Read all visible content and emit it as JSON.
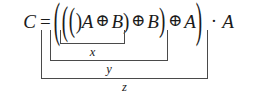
{
  "figure": {
    "kind": "math-equation-with-underbraces",
    "background_color": "#ffffff",
    "text_color": "#1a1a1a",
    "bracket_color": "#4a4a4a"
  },
  "equation": {
    "full_text": "C = (((A ⊕ B) ⊕ B) ⊕ A) · A",
    "lhs": "C",
    "relation": "=",
    "open_paren_1": "(",
    "open_paren_2": "(",
    "open_paren_3": "(",
    "operand_a1": "A",
    "xor_1": "⊕",
    "operand_b1": "B",
    "close_paren_1": ")",
    "xor_2": "⊕",
    "operand_b2": "B",
    "close_paren_2": ")",
    "xor_3": "⊕",
    "operand_a2": "A",
    "close_paren_3": ")",
    "and_dot": "·",
    "operand_a3": "A"
  },
  "annotations": {
    "inner": {
      "label": "x",
      "spans": "(A ⊕ B)"
    },
    "middle": {
      "label": "y",
      "spans": "((A ⊕ B) ⊕ B)"
    },
    "outer": {
      "label": "z",
      "spans": "(((A ⊕ B) ⊕ B) ⊕ A)"
    }
  }
}
